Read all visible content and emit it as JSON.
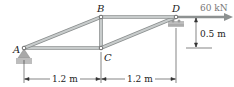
{
  "figure": {
    "type": "truss",
    "nodes": [
      {
        "id": "A",
        "label": "A"
      },
      {
        "id": "B",
        "label": "B"
      },
      {
        "id": "C",
        "label": "C"
      },
      {
        "id": "D",
        "label": "D"
      }
    ],
    "members": [
      "AB",
      "AC",
      "BC",
      "BD",
      "CD"
    ],
    "load": {
      "node": "D",
      "label": "60 kN",
      "direction": "right"
    },
    "supports": [
      {
        "node": "A",
        "type": "pin"
      },
      {
        "node": "D",
        "type": "roller"
      }
    ],
    "dimensions": {
      "span_AC": "1.2 m",
      "span_CD": "1.2 m",
      "height": "0.5 m"
    },
    "colors": {
      "member": "#b8bcbc",
      "member_edge": "#8a8e8e",
      "support": "#a9a9a9",
      "load_arrow": "#8d9191",
      "text": "#222222"
    }
  }
}
